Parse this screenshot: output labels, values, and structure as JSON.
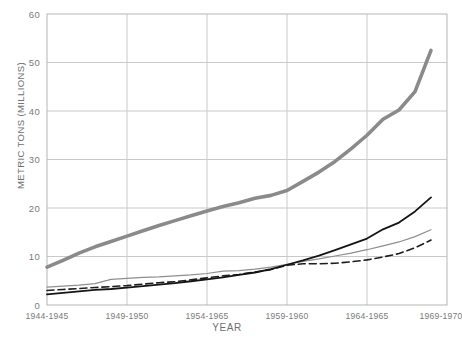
{
  "chart_data": {
    "type": "line",
    "title": "",
    "xlabel": "YEAR",
    "ylabel": "METRIC TONS (MILLIONS)",
    "ylim": [
      0,
      60
    ],
    "yticks": [
      0,
      10,
      20,
      30,
      40,
      50,
      60
    ],
    "grid": true,
    "legend": "none",
    "categories": [
      "1944-1945",
      "1949-1950",
      "1954-1965",
      "1959-1960",
      "1964-1965",
      "1969-1970"
    ],
    "x": [
      1944.5,
      1949.5,
      1954.5,
      1959.5,
      1964.5,
      1969.5
    ],
    "xlim": [
      1944.5,
      1969.5
    ],
    "series": [
      {
        "name": "thick-gray-series",
        "style": "solid",
        "color": "#8a8a8a",
        "width": 3.6,
        "x": [
          1944.5,
          1945.5,
          1946.5,
          1947.5,
          1948.5,
          1949.5,
          1950.5,
          1951.5,
          1952.5,
          1953.5,
          1954.5,
          1955.5,
          1956.5,
          1957.5,
          1958.5,
          1959.5,
          1960.5,
          1961.5,
          1962.5,
          1963.5,
          1964.5,
          1965.5,
          1966.5,
          1967.5,
          1968.5
        ],
        "values": [
          7.8,
          9.2,
          10.7,
          12.0,
          13.1,
          14.2,
          15.3,
          16.4,
          17.4,
          18.4,
          19.4,
          20.3,
          21.1,
          22.0,
          22.6,
          23.6,
          25.5,
          27.4,
          29.6,
          32.2,
          35.0,
          38.3,
          40.2,
          44.0,
          52.5
        ]
      },
      {
        "name": "thin-gray-series",
        "style": "solid",
        "color": "#8e8e8e",
        "width": 1.2,
        "x": [
          1944.5,
          1945.5,
          1946.5,
          1947.5,
          1948.5,
          1949.5,
          1950.5,
          1951.5,
          1952.5,
          1953.5,
          1954.5,
          1955.5,
          1956.5,
          1957.5,
          1958.5,
          1959.5,
          1960.5,
          1961.5,
          1962.5,
          1963.5,
          1964.5,
          1965.5,
          1966.5,
          1967.5,
          1968.5
        ],
        "values": [
          3.7,
          3.9,
          4.1,
          4.4,
          5.3,
          5.5,
          5.7,
          5.8,
          6.0,
          6.2,
          6.5,
          7.0,
          7.1,
          7.4,
          7.8,
          8.4,
          9.0,
          9.5,
          10.1,
          10.7,
          11.4,
          12.2,
          13.0,
          14.1,
          15.5
        ]
      },
      {
        "name": "dashed-black-series",
        "style": "dashed",
        "color": "#1e1e1e",
        "width": 1.6,
        "x": [
          1944.5,
          1945.5,
          1946.5,
          1947.5,
          1948.5,
          1949.5,
          1950.5,
          1951.5,
          1952.5,
          1953.5,
          1954.5,
          1955.5,
          1956.5,
          1957.5,
          1958.5,
          1959.5,
          1960.5,
          1961.5,
          1962.5,
          1963.5,
          1964.5,
          1965.5,
          1966.5,
          1967.5,
          1968.5
        ],
        "values": [
          3.0,
          3.2,
          3.4,
          3.6,
          3.8,
          4.0,
          4.3,
          4.6,
          4.8,
          5.2,
          5.6,
          6.0,
          6.3,
          6.8,
          7.3,
          8.2,
          8.5,
          8.5,
          8.6,
          8.9,
          9.3,
          9.9,
          10.6,
          11.8,
          13.4
        ]
      },
      {
        "name": "solid-black-series",
        "style": "solid",
        "color": "#141414",
        "width": 1.8,
        "x": [
          1944.5,
          1945.5,
          1946.5,
          1947.5,
          1948.5,
          1949.5,
          1950.5,
          1951.5,
          1952.5,
          1953.5,
          1954.5,
          1955.5,
          1956.5,
          1957.5,
          1958.5,
          1959.5,
          1960.5,
          1961.5,
          1962.5,
          1963.5,
          1964.5,
          1965.5,
          1966.5,
          1967.5,
          1968.5
        ],
        "values": [
          2.2,
          2.5,
          2.8,
          3.1,
          3.3,
          3.6,
          3.9,
          4.2,
          4.5,
          4.9,
          5.3,
          5.7,
          6.2,
          6.7,
          7.4,
          8.3,
          9.2,
          10.2,
          11.3,
          12.5,
          13.7,
          15.6,
          17.0,
          19.3,
          22.2
        ]
      }
    ]
  },
  "axes": {
    "y_title": "METRIC TONS (MILLIONS)",
    "x_title": "YEAR",
    "y_ticks": [
      "60",
      "50",
      "40",
      "30",
      "20",
      "10",
      "0"
    ],
    "x_ticks": [
      "1944-1945",
      "1949-1950",
      "1954-1965",
      "1959-1960",
      "1964-1965",
      "1969-1970"
    ]
  },
  "colors": {
    "grid": "#c9c9c9",
    "frame": "#b5b5b5",
    "text": "#6f6f6f",
    "thick_gray": "#8a8a8a",
    "thin_gray": "#8e8e8e",
    "black": "#141414"
  }
}
